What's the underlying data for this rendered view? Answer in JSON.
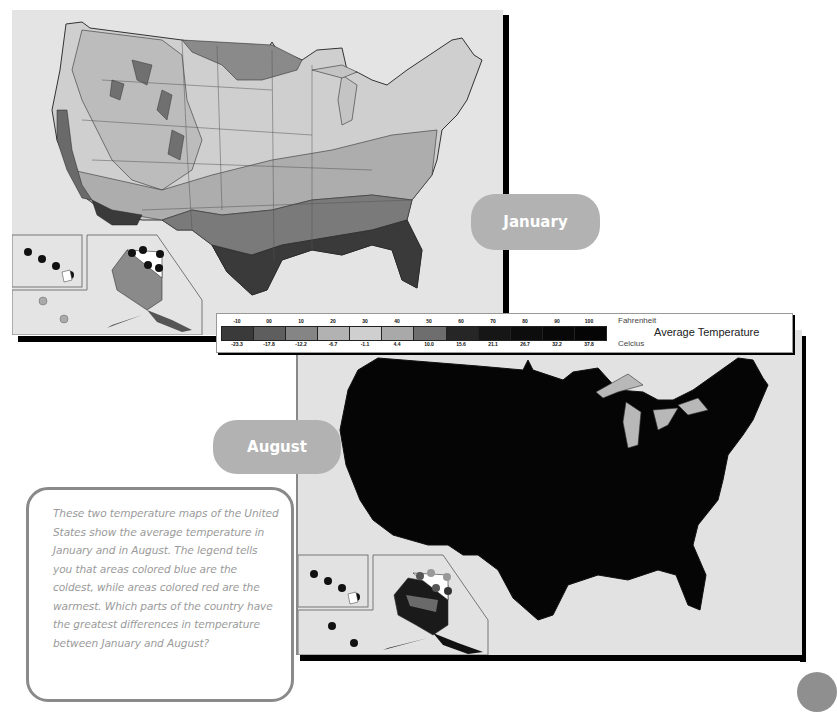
{
  "labels": {
    "january": "January",
    "august": "August"
  },
  "legend": {
    "title": "Average Temperature",
    "fahrenheit_label": "Fahrenheit",
    "celsius_label": "Celcius",
    "fahrenheit_ticks": [
      "-10",
      "00",
      "10",
      "20",
      "30",
      "40",
      "50",
      "60",
      "70",
      "80",
      "90",
      "100"
    ],
    "celsius_ticks": [
      "-23.3",
      "-17.8",
      "-12.2",
      "-6.7",
      "-1.1",
      "4.4",
      "10.0",
      "15.6",
      "21.1",
      "26.7",
      "32.2",
      "37.8"
    ],
    "swatch_colors": [
      "#3a3a3a",
      "#5e5e5e",
      "#858585",
      "#b2b2b2",
      "#cfcfcf",
      "#a9a9a9",
      "#6e6e6e",
      "#262626",
      "#161616",
      "#0d0d0d",
      "#080808",
      "#050505"
    ]
  },
  "maps": {
    "january": {
      "caption": "January",
      "background": "#e4e4e4"
    },
    "august": {
      "caption": "August",
      "background": "#e2e2e2"
    }
  },
  "text_box": {
    "body": "These two temperature maps of the United States show the average temperature in January and in August. The legend tells you that areas colored blue are the coldest, while areas colored red are the warmest. Which parts of the country have the greatest differences in temperature between January and August?"
  },
  "colors": {
    "pill": "#b2b2b2",
    "frame_shadow": "#000000",
    "text": "#9a9a9a",
    "textbox_border": "#8a8a8a"
  }
}
